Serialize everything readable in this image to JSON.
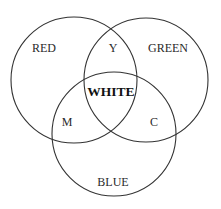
{
  "diagram": {
    "type": "venn",
    "sets": [
      {
        "id": "red",
        "label": "RED"
      },
      {
        "id": "green",
        "label": "GREEN"
      },
      {
        "id": "blue",
        "label": "BLUE"
      }
    ],
    "intersections": [
      {
        "sets": [
          "red",
          "green"
        ],
        "label": "Y"
      },
      {
        "sets": [
          "red",
          "blue"
        ],
        "label": "M"
      },
      {
        "sets": [
          "green",
          "blue"
        ],
        "label": "C"
      },
      {
        "sets": [
          "red",
          "green",
          "blue"
        ],
        "label": "WHITE"
      }
    ],
    "colors": {
      "stroke": "#333333",
      "text": "#2a2a2a",
      "background": "#ffffff"
    }
  }
}
